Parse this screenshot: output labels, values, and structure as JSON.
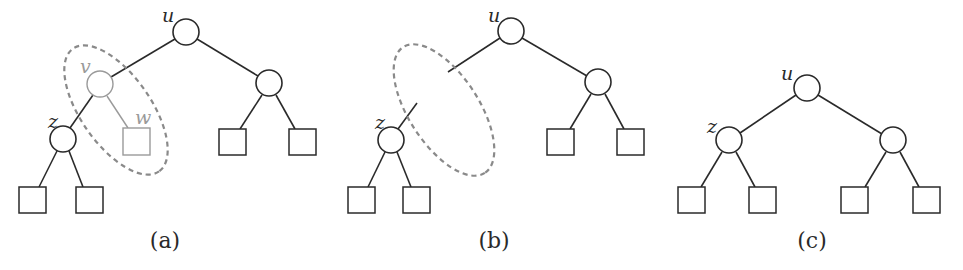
{
  "figure": {
    "colors": {
      "stroke": "#2a2a2a",
      "faded": "#9a9a9a",
      "dashed": "#8a8a8a",
      "background": "#ffffff"
    },
    "panels": [
      {
        "id": "a",
        "caption": "(a)",
        "labels": {
          "u": "u",
          "v": "v",
          "w": "w",
          "z": "z"
        }
      },
      {
        "id": "b",
        "caption": "(b)",
        "labels": {
          "u": "u",
          "z": "z"
        }
      },
      {
        "id": "c",
        "caption": "(c)",
        "labels": {
          "u": "u",
          "z": "z"
        }
      }
    ]
  }
}
